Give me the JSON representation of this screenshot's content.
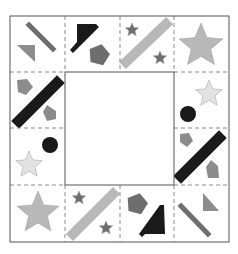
{
  "puzzle": {
    "colors": {
      "black": "#1a1a1a",
      "dark_gray": "#6e6e6e",
      "mid_gray": "#8c8c8c",
      "light_gray": "#b8b8b8",
      "very_light_gray": "#e2e2e2",
      "border": "#555555",
      "dashed": "#8a8a8a"
    },
    "grid": {
      "x": [
        10,
        65,
        120,
        174,
        229
      ],
      "y": [
        16,
        72,
        128,
        185,
        242
      ]
    },
    "center_blank": {
      "x": 65,
      "y": 72,
      "w": 109,
      "h": 113,
      "label": "missing-piece-area"
    },
    "tiles": [
      {
        "id": "r0c0",
        "row": 0,
        "col": 0,
        "shapes": [
          {
            "kind": "bar",
            "color": "dark_gray",
            "x1": 29,
            "y1": 25,
            "x2": 53,
            "y2": 49,
            "w": 5
          },
          {
            "kind": "poly",
            "color": "mid_gray",
            "points": "17,45 35,45 35,62"
          }
        ]
      },
      {
        "id": "r0c1",
        "row": 0,
        "col": 1,
        "shapes": [
          {
            "kind": "poly",
            "color": "black",
            "points": "77,24 96,24 99,27 73,53 70,50 77,42"
          },
          {
            "kind": "pentagon",
            "color": "dark_gray",
            "cx": 99,
            "cy": 55,
            "r": 11
          }
        ]
      },
      {
        "id": "r0c2",
        "row": 0,
        "col": 2,
        "shapes": [
          {
            "kind": "star",
            "color": "dark_gray",
            "cx": 132,
            "cy": 30,
            "r": 7
          },
          {
            "kind": "bar",
            "color": "light_gray",
            "x1": 126,
            "y1": 62,
            "x2": 166,
            "y2": 24,
            "w": 10
          },
          {
            "kind": "star",
            "color": "dark_gray",
            "cx": 160,
            "cy": 58,
            "r": 7
          }
        ]
      },
      {
        "id": "r0c3",
        "row": 0,
        "col": 3,
        "shapes": [
          {
            "kind": "star",
            "color": "light_gray",
            "cx": 201,
            "cy": 46,
            "r": 23
          }
        ]
      },
      {
        "id": "r1c0",
        "row": 1,
        "col": 0,
        "shapes": [
          {
            "kind": "poly",
            "color": "mid_gray",
            "points": "17,80 27,79 33,87 26,95 18,92"
          },
          {
            "kind": "bar",
            "color": "black",
            "x1": 19,
            "y1": 121,
            "x2": 57,
            "y2": 83,
            "w": 11
          },
          {
            "kind": "poly",
            "color": "mid_gray",
            "points": "47,105 56,111 56,119 47,121 43,112"
          }
        ]
      },
      {
        "id": "r1c3",
        "row": 1,
        "col": 3,
        "shapes": [
          {
            "kind": "star",
            "color": "very_light_gray",
            "cx": 209,
            "cy": 94,
            "r": 14
          },
          {
            "kind": "circle",
            "color": "black",
            "cx": 188,
            "cy": 114,
            "r": 8
          }
        ]
      },
      {
        "id": "r2c0",
        "row": 2,
        "col": 0,
        "shapes": [
          {
            "kind": "circle",
            "color": "black",
            "cx": 50,
            "cy": 145,
            "r": 8
          },
          {
            "kind": "star",
            "color": "very_light_gray",
            "cx": 29,
            "cy": 165,
            "r": 14
          }
        ]
      },
      {
        "id": "r2c3",
        "row": 2,
        "col": 3,
        "shapes": [
          {
            "kind": "poly",
            "color": "mid_gray",
            "points": "180,134 189,133 193,141 187,147 180,142"
          },
          {
            "kind": "bar",
            "color": "black",
            "x1": 181,
            "y1": 176,
            "x2": 219,
            "y2": 138,
            "w": 11
          },
          {
            "kind": "poly",
            "color": "mid_gray",
            "points": "211,160 218,166 219,178 208,178 206,167"
          }
        ]
      },
      {
        "id": "r3c0",
        "row": 3,
        "col": 0,
        "shapes": [
          {
            "kind": "star",
            "color": "light_gray",
            "cx": 38,
            "cy": 213,
            "r": 22
          }
        ]
      },
      {
        "id": "r3c1",
        "row": 3,
        "col": 1,
        "shapes": [
          {
            "kind": "star",
            "color": "dark_gray",
            "cx": 79,
            "cy": 198,
            "r": 7
          },
          {
            "kind": "bar",
            "color": "light_gray",
            "x1": 73,
            "y1": 234,
            "x2": 113,
            "y2": 194,
            "w": 10
          },
          {
            "kind": "star",
            "color": "dark_gray",
            "cx": 106,
            "cy": 228,
            "r": 7
          }
        ]
      },
      {
        "id": "r3c2",
        "row": 3,
        "col": 2,
        "shapes": [
          {
            "kind": "pentagon",
            "color": "dark_gray",
            "cx": 137,
            "cy": 204,
            "r": 11
          },
          {
            "kind": "poly",
            "color": "black",
            "points": "164,205 165,234 145,234 142,237 139,234 160,205"
          }
        ]
      },
      {
        "id": "r3c3",
        "row": 3,
        "col": 3,
        "shapes": [
          {
            "kind": "poly",
            "color": "mid_gray",
            "points": "203,193 203,211 219,211"
          },
          {
            "kind": "bar",
            "color": "dark_gray",
            "x1": 181,
            "y1": 206,
            "x2": 208,
            "y2": 234,
            "w": 5
          }
        ]
      }
    ]
  }
}
